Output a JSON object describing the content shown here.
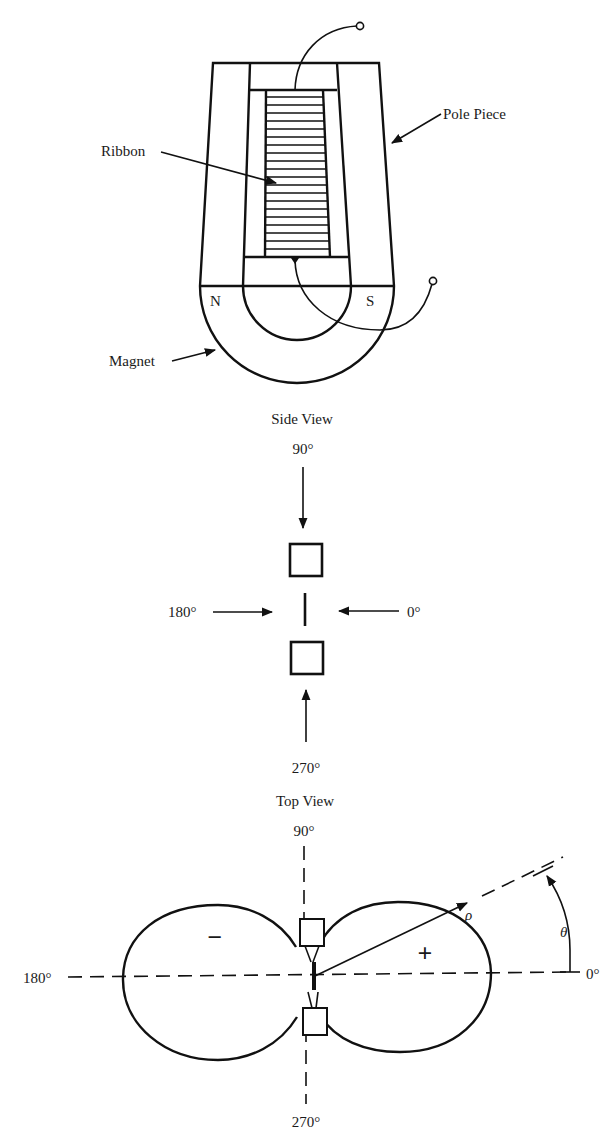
{
  "diagram": {
    "colors": {
      "line": "#111111",
      "background": "#ffffff"
    },
    "device": {
      "labels": {
        "ribbon": "Ribbon",
        "pole_piece": "Pole Piece",
        "magnet": "Magnet",
        "north": "N",
        "south": "S"
      },
      "ribbon_corrugations": 21
    },
    "side_view": {
      "caption": "Side View",
      "angles": {
        "top": "90°",
        "left": "180°",
        "right": "0°",
        "bottom": "270°"
      }
    },
    "top_view": {
      "caption": "Top View",
      "angles": {
        "top": "90°",
        "left": "180°",
        "right": "0°",
        "bottom": "270°"
      },
      "lobes": {
        "left_sign": "−",
        "right_sign": "+"
      },
      "radius_symbol": "ρ",
      "angle_symbol": "θ"
    }
  }
}
